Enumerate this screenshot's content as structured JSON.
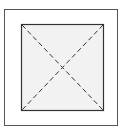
{
  "diagram": {
    "type": "placeholder-image-frame",
    "outer_frame": {
      "x": 4,
      "y": 9,
      "width": 114,
      "height": 117,
      "stroke": "#555555"
    },
    "inner_square": {
      "x": 21,
      "y": 24,
      "width": 82,
      "height": 86,
      "fill": "#f2f2f2",
      "stroke": "#333333"
    },
    "diagonals": {
      "style": "dashed",
      "stroke": "#333333",
      "count": 2
    }
  }
}
